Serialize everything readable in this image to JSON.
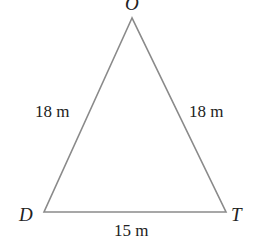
{
  "diagram": {
    "type": "isosceles-triangle",
    "vertices": {
      "top": {
        "label": "O",
        "x": 132,
        "y": 18
      },
      "left": {
        "label": "D",
        "x": 44,
        "y": 212
      },
      "right": {
        "label": "T",
        "x": 226,
        "y": 212
      }
    },
    "sides": {
      "left": "18 m",
      "right": "18 m",
      "base": "15 m"
    },
    "line_color": "#8a8a8a"
  }
}
